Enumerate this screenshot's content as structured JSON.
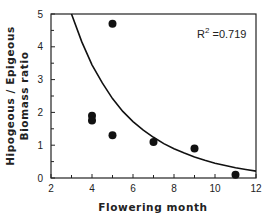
{
  "chart_data": {
    "type": "scatter",
    "title": "",
    "xlabel": "Flowering month",
    "ylabel_lines": [
      "Hipogeous / Epigeous",
      "Biomass ratio"
    ],
    "ylabel": "Hipogeous / Epigeous Biomass ratio",
    "xlim": [
      2,
      12
    ],
    "ylim": [
      0,
      5
    ],
    "x_ticks": [
      2,
      4,
      6,
      8,
      10,
      12
    ],
    "x_minor_ticks": [
      3,
      5,
      7,
      9,
      11
    ],
    "y_ticks": [
      0,
      1,
      2,
      3,
      4,
      5
    ],
    "y_minor_ticks": [
      0.5,
      1.5,
      2.5,
      3.5,
      4.5
    ],
    "grid": false,
    "legend": null,
    "annotation": {
      "text_main": "R",
      "text_sup": "2",
      "text_rest": " =0.719",
      "x": 9.9,
      "y": 4.55
    },
    "series": [
      {
        "name": "observations",
        "marker": "filled-circle",
        "color": "#111111",
        "points": [
          {
            "x": 4,
            "y": 1.9
          },
          {
            "x": 4,
            "y": 1.75
          },
          {
            "x": 5,
            "y": 4.7
          },
          {
            "x": 5,
            "y": 1.3
          },
          {
            "x": 7,
            "y": 1.1
          },
          {
            "x": 9,
            "y": 0.9
          },
          {
            "x": 11,
            "y": 0.1
          }
        ]
      },
      {
        "name": "fitted-curve",
        "type": "line",
        "color": "#111111",
        "points": [
          {
            "x": 3.0,
            "y": 5.0
          },
          {
            "x": 3.5,
            "y": 4.15
          },
          {
            "x": 4.0,
            "y": 3.45
          },
          {
            "x": 4.5,
            "y": 2.9
          },
          {
            "x": 5.0,
            "y": 2.42
          },
          {
            "x": 5.5,
            "y": 2.03
          },
          {
            "x": 6.0,
            "y": 1.72
          },
          {
            "x": 6.5,
            "y": 1.46
          },
          {
            "x": 7.0,
            "y": 1.24
          },
          {
            "x": 7.5,
            "y": 1.05
          },
          {
            "x": 8.0,
            "y": 0.89
          },
          {
            "x": 8.5,
            "y": 0.76
          },
          {
            "x": 9.0,
            "y": 0.64
          },
          {
            "x": 9.5,
            "y": 0.54
          },
          {
            "x": 10.0,
            "y": 0.45
          },
          {
            "x": 10.5,
            "y": 0.38
          },
          {
            "x": 11.0,
            "y": 0.31
          },
          {
            "x": 11.5,
            "y": 0.26
          },
          {
            "x": 12.0,
            "y": 0.21
          }
        ]
      }
    ]
  },
  "layout": {
    "plot_left": 51,
    "plot_right": 256,
    "plot_top": 14,
    "plot_bottom": 178
  }
}
